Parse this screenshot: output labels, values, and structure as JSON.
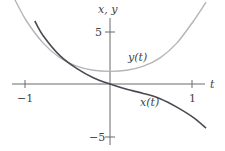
{
  "chart_data": {
    "type": "line",
    "title": "",
    "xlabel": "t",
    "ylabel": "x, y",
    "xlim": [
      -1.15,
      1.2
    ],
    "ylim": [
      -6,
      8
    ],
    "grid": false,
    "legend": "inline labels",
    "x_ticks": [
      {
        "value": -1,
        "label": "−1"
      },
      {
        "value": 1,
        "label": "1"
      }
    ],
    "y_ticks": [
      {
        "value": 5,
        "label": "5"
      },
      {
        "value": -5,
        "label": "−5"
      }
    ],
    "series": [
      {
        "name": "y(t)",
        "color": "#b5b5b5",
        "x": [
          -1.15,
          -1.0,
          -0.8,
          -0.6,
          -0.4,
          -0.2,
          0.0,
          0.2,
          0.4,
          0.6,
          0.8,
          1.0,
          1.15
        ],
        "values": [
          8.2,
          6.0,
          3.9,
          2.5,
          1.7,
          1.3,
          1.2,
          1.3,
          1.7,
          2.5,
          3.9,
          6.0,
          7.8
        ]
      },
      {
        "name": "x(t)",
        "color": "#4a4a55",
        "x": [
          -0.9,
          -0.8,
          -0.6,
          -0.4,
          -0.2,
          0.0,
          0.2,
          0.4,
          0.6,
          0.8,
          1.0,
          1.15
        ],
        "values": [
          6.0,
          4.6,
          2.7,
          1.5,
          0.6,
          0.0,
          -0.5,
          -0.9,
          -1.4,
          -2.2,
          -3.2,
          -4.2
        ]
      }
    ],
    "annotations": [
      {
        "text": "y(t)",
        "x": 0.45,
        "y": 3.0
      },
      {
        "text": "x(t)",
        "x": 0.55,
        "y": -2.0
      }
    ]
  },
  "labels": {
    "axis_y": "x, y",
    "axis_x": "t",
    "tick_y_pos": "5",
    "tick_y_neg": "−5",
    "tick_x_neg": "−1",
    "tick_x_pos": "1",
    "curve_y": "y(t)",
    "curve_x": "x(t)"
  }
}
